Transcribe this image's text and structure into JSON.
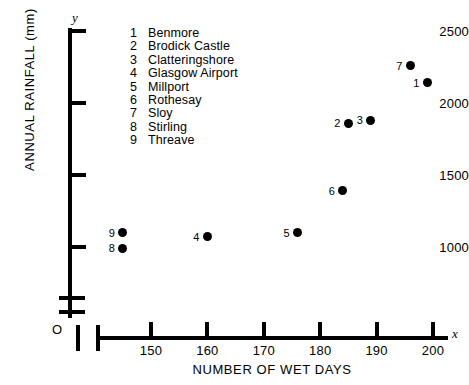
{
  "chart_data": {
    "type": "scatter",
    "title": "",
    "xlabel": "NUMBER OF WET DAYS",
    "ylabel": "ANNUAL RAINFALL (mm)",
    "x_axis_symbol": "x",
    "y_axis_symbol": "y",
    "origin_label": "O",
    "xlim": [
      143,
      203
    ],
    "ylim": [
      900,
      2500
    ],
    "xticks": [
      150,
      160,
      170,
      180,
      190,
      200
    ],
    "yticks": [
      1000,
      1500,
      2000,
      2500
    ],
    "xtick_labels": [
      "150",
      "160",
      "170",
      "180",
      "190",
      "200"
    ],
    "ytick_labels": [
      "1000",
      "1500",
      "2000",
      "2500"
    ],
    "grid": false,
    "axis_break_x": true,
    "axis_break_y": true,
    "legend_position": "upper-left-inside",
    "points": [
      {
        "key": "1",
        "name": "Benmore",
        "x": 199,
        "y": 2140
      },
      {
        "key": "2",
        "name": "Brodick Castle",
        "x": 185,
        "y": 1860
      },
      {
        "key": "3",
        "name": "Clatteringshore",
        "x": 189,
        "y": 1880
      },
      {
        "key": "4",
        "name": "Glasgow Airport",
        "x": 160,
        "y": 1070
      },
      {
        "key": "5",
        "name": "Millport",
        "x": 176,
        "y": 1100
      },
      {
        "key": "6",
        "name": "Rothesay",
        "x": 184,
        "y": 1390
      },
      {
        "key": "7",
        "name": "Sloy",
        "x": 196,
        "y": 2260
      },
      {
        "key": "8",
        "name": "Stirling",
        "x": 145,
        "y": 990
      },
      {
        "key": "9",
        "name": "Threave",
        "x": 145,
        "y": 1100
      }
    ],
    "legend_entries": [
      {
        "key": "1",
        "name": "Benmore"
      },
      {
        "key": "2",
        "name": "Brodick Castle"
      },
      {
        "key": "3",
        "name": "Clatteringshore"
      },
      {
        "key": "4",
        "name": "Glasgow Airport"
      },
      {
        "key": "5",
        "name": "Millport"
      },
      {
        "key": "6",
        "name": "Rothesay"
      },
      {
        "key": "7",
        "name": "Sloy"
      },
      {
        "key": "8",
        "name": "Stirling"
      },
      {
        "key": "9",
        "name": "Threave"
      }
    ],
    "marker_color": "#000000",
    "axis_color": "#000000"
  }
}
